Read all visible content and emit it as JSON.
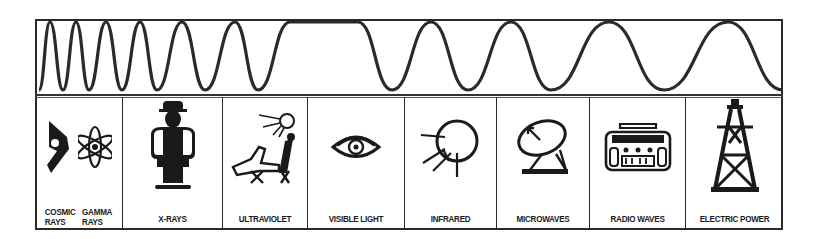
{
  "wave": {
    "description": "Sine wave with wavelength increasing from left to right",
    "stroke_color": "#2a2a2a",
    "peaks_x": [
      50,
      76,
      106,
      140,
      182,
      235,
      290,
      358,
      431,
      511,
      609,
      728
    ],
    "troughs_x": [
      39,
      63,
      89,
      122,
      157,
      205,
      258,
      392,
      468,
      551,
      664,
      783
    ],
    "peak_y": 22,
    "trough_y": 90
  },
  "bands": [
    {
      "id": "cosmic-gamma",
      "label_a_line1": "COSMIC",
      "label_a_line2": "RAYS",
      "label_b_line1": "GAMMA",
      "label_b_line2": "RAYS",
      "icon_a": "cosmic-ray-icon",
      "icon_b": "atom-icon"
    },
    {
      "id": "x-rays",
      "label": "X-RAYS",
      "icon": "x-ray-person-icon"
    },
    {
      "id": "ultraviolet",
      "label": "ULTRAVIOLET",
      "icon": "sunbather-icon"
    },
    {
      "id": "visible-light",
      "label": "VISIBLE LIGHT",
      "icon": "eye-icon"
    },
    {
      "id": "infrared",
      "label": "INFRARED",
      "icon": "heat-radiating-circle-icon"
    },
    {
      "id": "microwaves",
      "label": "MICROWAVES",
      "icon": "satellite-dish-icon"
    },
    {
      "id": "radio-waves",
      "label": "RADIO WAVES",
      "icon": "radio-icon"
    },
    {
      "id": "electric-power",
      "label": "ELECTRIC POWER",
      "icon": "power-tower-icon"
    }
  ],
  "colors": {
    "ink": "#1a1a1a",
    "background": "#ffffff"
  }
}
